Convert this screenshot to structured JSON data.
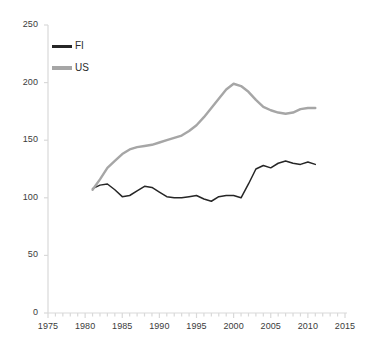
{
  "chart_data": {
    "type": "line",
    "title": "",
    "subtitle": "",
    "xlabel": "",
    "ylabel": "",
    "xlim": [
      1975,
      2015
    ],
    "ylim": [
      0,
      250
    ],
    "grid": false,
    "legend_position": "top-left",
    "x_ticks": [
      "1975",
      "1980",
      "1985",
      "1990",
      "1995",
      "2000",
      "2005",
      "2010",
      "2015"
    ],
    "x_tick_values": [
      1975,
      1980,
      1985,
      1990,
      1995,
      2000,
      2005,
      2010,
      2015
    ],
    "x_minor_tick_interval": 1,
    "y_ticks": [
      "0",
      "50",
      "100",
      "150",
      "200",
      "250"
    ],
    "y_tick_values": [
      0,
      50,
      100,
      150,
      200,
      250
    ],
    "x": [
      1981,
      1982,
      1983,
      1984,
      1985,
      1986,
      1987,
      1988,
      1989,
      1990,
      1991,
      1992,
      1993,
      1994,
      1995,
      1996,
      1997,
      1998,
      1999,
      2000,
      2001,
      2002,
      2003,
      2004,
      2005,
      2006,
      2007,
      2008,
      2009,
      2010,
      2011
    ],
    "series": [
      {
        "name": "FI",
        "color": "#262626",
        "values": [
          108,
          111,
          112,
          107,
          101,
          102,
          106,
          110,
          109,
          105,
          101,
          100,
          100,
          101,
          102,
          99,
          97,
          101,
          102,
          102,
          100,
          112,
          125,
          128,
          126,
          130,
          132,
          130,
          129,
          131,
          129
        ]
      },
      {
        "name": "US",
        "color": "#a6a6a6",
        "values": [
          107,
          116,
          126,
          132,
          138,
          142,
          144,
          145,
          146,
          148,
          150,
          152,
          154,
          158,
          163,
          170,
          178,
          186,
          194,
          199,
          197,
          192,
          185,
          179,
          176,
          174,
          173,
          174,
          177,
          178,
          178
        ]
      }
    ]
  },
  "legend": {
    "items": [
      {
        "label": "FI",
        "color": "#262626"
      },
      {
        "label": "US",
        "color": "#a6a6a6"
      }
    ]
  },
  "axis_colors": {
    "axis_line": "#d9d9d9",
    "tick_text": "#3b3b3b"
  }
}
